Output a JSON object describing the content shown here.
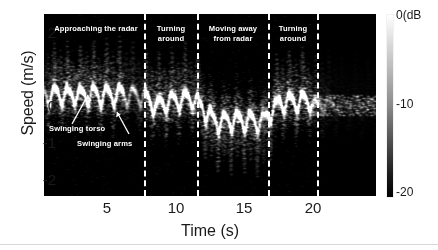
{
  "chart_data": {
    "type": "heatmap",
    "title": "",
    "subtitle": "",
    "xlabel": "Time (s)",
    "ylabel": "Speed (m/s)",
    "xlim": [
      0.4,
      24.6
    ],
    "ylim": [
      -2.45,
      2.45
    ],
    "xticks": [
      5,
      10,
      15,
      20
    ],
    "xtick_labels": [
      "5",
      "10",
      "15",
      "20"
    ],
    "yticks": [
      2,
      1,
      0,
      -1,
      -2
    ],
    "ytick_labels": [
      "2",
      "1",
      "0",
      "-1",
      "-2"
    ],
    "grid": false,
    "legend_position": "none",
    "colormap": "gray",
    "colorbar": {
      "label": "0(dB",
      "ticks": [
        0,
        -10,
        -20
      ],
      "tick_labels": [
        "0(dB",
        "-10",
        "-20"
      ],
      "vmin": -20,
      "vmax": 0,
      "orientation": "vertical",
      "position": "right"
    },
    "segment_dividers_t": [
      7.35,
      11.25,
      16.4,
      19.95
    ],
    "segments": [
      {
        "label": "Approaching the radar",
        "t_start": 0.4,
        "t_end": 7.35,
        "label_t": 3.2,
        "label_v": 2.05
      },
      {
        "label": "Turning\naround",
        "t_start": 7.35,
        "t_end": 11.25,
        "label_t": 9.3,
        "label_v": 2.05
      },
      {
        "label": "Moving away\nfrom radar",
        "t_start": 11.25,
        "t_end": 16.4,
        "label_t": 13.8,
        "label_v": 2.05
      },
      {
        "label": "Turning\naround",
        "t_start": 16.4,
        "t_end": 19.95,
        "label_t": 18.2,
        "label_v": 2.05
      }
    ],
    "annotations": [
      {
        "text": "Swinging torso",
        "label_t": 2.3,
        "label_v": -0.95,
        "arrow_to_t": 2.35,
        "arrow_to_v": 0.22
      },
      {
        "text": "Swinging arms",
        "label_t": 4.2,
        "label_v": -1.3,
        "arrow_to_t": 4.75,
        "arrow_to_v": -0.45
      }
    ]
  },
  "axes": {
    "y_label": "Speed (m/s)",
    "x_label": "Time (s)",
    "y_ticks": [
      "2",
      "1",
      "0",
      "-1",
      "-2"
    ],
    "x_ticks": [
      "5",
      "10",
      "15",
      "20"
    ]
  },
  "colorbar": {
    "top_label": "0(dB",
    "mid_label": "-10",
    "bottom_label": "-20"
  },
  "regions": [
    {
      "label": "Approaching the radar"
    },
    {
      "label": "Turning\naround"
    },
    {
      "label": "Moving away\nfrom radar"
    },
    {
      "label": "Turning\naround"
    }
  ],
  "callouts": [
    {
      "label": "Swinging torso"
    },
    {
      "label": "Swinging arms"
    }
  ]
}
